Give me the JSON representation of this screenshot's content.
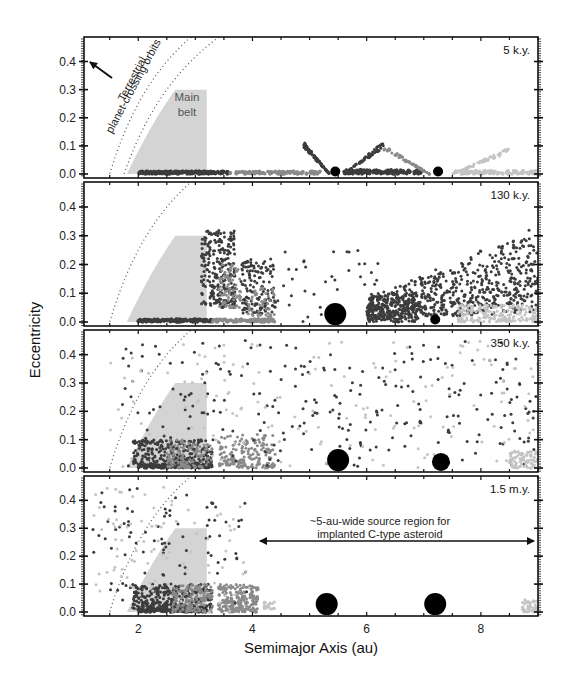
{
  "chart_data": {
    "type": "scatter",
    "layout": "4 vertically stacked panels sharing x-axis",
    "xlabel": "Semimajor Axis (au)",
    "ylabel": "Eccentricity",
    "xlim": [
      1.05,
      9.0
    ],
    "ylim": [
      -0.02,
      0.48
    ],
    "x_ticks": [
      2,
      4,
      6,
      8
    ],
    "y_ticks": [
      0.0,
      0.1,
      0.2,
      0.3,
      0.4
    ],
    "y_tick_labels": [
      "0.0",
      "0.1",
      "0.2",
      "0.3",
      "0.4"
    ],
    "grid": false,
    "colors": {
      "main_belt": "#d4d4d4",
      "dark_points": "#3c3c3c",
      "mid_points": "#8a8a8a",
      "light_points": "#c4c4c4",
      "planet": "#000000",
      "curve": "#555555"
    },
    "main_belt_region": {
      "a_min": 1.8,
      "a_max": 3.2,
      "e_max": 0.3,
      "label": "Main belt"
    },
    "planet_crossing_curve": {
      "description": "dotted line q = 1.3 au (e = 1 - 1.3/a)",
      "q": 1.3
    },
    "annotations": {
      "terrestrial": "Terrestrial planet-crossing orbits",
      "terrestrial_line1": "Terrestrial",
      "terrestrial_line2": "planet-crossing orbits",
      "source_region_line1": "~5-au-wide source region for",
      "source_region_line2": "implanted C-type asteroid",
      "source_region_range": [
        4.1,
        8.9
      ],
      "source_region_e": 0.25
    },
    "panels": [
      {
        "label": "5 k.y.",
        "planets": [
          {
            "name": "Jupiter",
            "a": 5.45,
            "e": 0.0,
            "size": "small"
          },
          {
            "name": "Saturn",
            "a": 7.25,
            "e": 0.0,
            "size": "small"
          }
        ],
        "clusters": [
          {
            "shade": "dark",
            "kind": "band",
            "a": [
              2.0,
              3.6
            ],
            "e": [
              0.0,
              0.01
            ],
            "n": 220
          },
          {
            "shade": "mid",
            "kind": "band",
            "a": [
              3.6,
              5.2
            ],
            "e": [
              0.0,
              0.01
            ],
            "n": 120
          },
          {
            "shade": "dark",
            "kind": "wedge",
            "a": [
              4.9,
              5.35
            ],
            "e_at_a0": 0.11,
            "e_at_a1": 0.0,
            "n": 90
          },
          {
            "shade": "dark",
            "kind": "band",
            "a": [
              5.6,
              7.0
            ],
            "e": [
              0.0,
              0.015
            ],
            "n": 160
          },
          {
            "shade": "dark",
            "kind": "wedge",
            "a": [
              5.6,
              6.3
            ],
            "e_at_a0": 0.0,
            "e_at_a1": 0.11,
            "n": 80
          },
          {
            "shade": "mid",
            "kind": "wedge",
            "a": [
              6.3,
              7.1
            ],
            "e_at_a0": 0.1,
            "e_at_a1": 0.0,
            "n": 70
          },
          {
            "shade": "light",
            "kind": "band",
            "a": [
              7.5,
              9.0
            ],
            "e": [
              0.0,
              0.012
            ],
            "n": 110
          },
          {
            "shade": "light",
            "kind": "wedge",
            "a": [
              7.5,
              8.5
            ],
            "e_at_a0": 0.0,
            "e_at_a1": 0.09,
            "n": 70
          }
        ]
      },
      {
        "label": "130 k.y.",
        "planets": [
          {
            "name": "Jupiter",
            "a": 5.45,
            "e": 0.0,
            "size": "large"
          },
          {
            "name": "Saturn",
            "a": 7.2,
            "e": 0.0,
            "size": "small"
          }
        ],
        "clusters": [
          {
            "shade": "dark",
            "kind": "band",
            "a": [
              2.0,
              3.3
            ],
            "e": [
              0.0,
              0.01
            ],
            "n": 150
          },
          {
            "shade": "mid",
            "kind": "band",
            "a": [
              3.3,
              4.4
            ],
            "e": [
              0.0,
              0.01
            ],
            "n": 90
          },
          {
            "shade": "dark",
            "kind": "box",
            "a": [
              3.1,
              3.7
            ],
            "e": [
              0.05,
              0.32
            ],
            "n": 260
          },
          {
            "shade": "mid",
            "kind": "box",
            "a": [
              3.4,
              3.8
            ],
            "e": [
              0.05,
              0.2
            ],
            "n": 80
          },
          {
            "shade": "dark",
            "kind": "box",
            "a": [
              3.8,
              4.4
            ],
            "e": [
              0.03,
              0.22
            ],
            "n": 140
          },
          {
            "shade": "mid",
            "kind": "box",
            "a": [
              3.9,
              4.4
            ],
            "e": [
              0.0,
              0.12
            ],
            "n": 60
          },
          {
            "shade": "dark",
            "kind": "scatter",
            "a": [
              4.4,
              6.2
            ],
            "e": [
              0.0,
              0.25
            ],
            "n": 40
          },
          {
            "shade": "dark",
            "kind": "box",
            "a": [
              6.0,
              6.9
            ],
            "e": [
              0.0,
              0.1
            ],
            "n": 160
          },
          {
            "shade": "dark",
            "kind": "wedge_fill",
            "a": [
              6.0,
              9.0
            ],
            "e_at_a0": 0.08,
            "e_at_a1": 0.34,
            "n": 700
          },
          {
            "shade": "light",
            "kind": "box",
            "a": [
              7.6,
              9.0
            ],
            "e": [
              0.0,
              0.06
            ],
            "n": 200
          }
        ]
      },
      {
        "label": "350 k.y.",
        "planets": [
          {
            "name": "Jupiter",
            "a": 5.5,
            "e": 0.0,
            "size": "large"
          },
          {
            "name": "Saturn",
            "a": 7.3,
            "e": 0.0,
            "size": "medium"
          }
        ],
        "clusters": [
          {
            "shade": "dark",
            "kind": "band",
            "a": [
              2.0,
              3.3
            ],
            "e": [
              0.0,
              0.01
            ],
            "n": 140
          },
          {
            "shade": "dark",
            "kind": "box",
            "a": [
              1.9,
              3.3
            ],
            "e": [
              0.01,
              0.1
            ],
            "n": 260
          },
          {
            "shade": "mid",
            "kind": "box",
            "a": [
              2.5,
              3.3
            ],
            "e": [
              0.0,
              0.1
            ],
            "n": 120
          },
          {
            "shade": "mid",
            "kind": "box",
            "a": [
              3.4,
              4.4
            ],
            "e": [
              0.0,
              0.12
            ],
            "n": 180
          },
          {
            "shade": "dark",
            "kind": "scatter",
            "a": [
              1.7,
              9.0
            ],
            "e": [
              0.0,
              0.45
            ],
            "n": 260
          },
          {
            "shade": "light",
            "kind": "scatter",
            "a": [
              1.5,
              9.0
            ],
            "e": [
              0.0,
              0.45
            ],
            "n": 160
          },
          {
            "shade": "light",
            "kind": "box",
            "a": [
              8.5,
              9.0
            ],
            "e": [
              0.0,
              0.06
            ],
            "n": 90
          }
        ]
      },
      {
        "label": "1.5 m.y.",
        "planets": [
          {
            "name": "Jupiter",
            "a": 5.3,
            "e": 0.0,
            "size": "large"
          },
          {
            "name": "Saturn",
            "a": 7.2,
            "e": 0.0,
            "size": "large"
          }
        ],
        "clusters": [
          {
            "shade": "dark",
            "kind": "band",
            "a": [
              2.0,
              3.2
            ],
            "e": [
              0.0,
              0.01
            ],
            "n": 130
          },
          {
            "shade": "dark",
            "kind": "box",
            "a": [
              1.9,
              3.3
            ],
            "e": [
              0.01,
              0.1
            ],
            "n": 300
          },
          {
            "shade": "mid",
            "kind": "box",
            "a": [
              2.6,
              3.3
            ],
            "e": [
              0.0,
              0.1
            ],
            "n": 140
          },
          {
            "shade": "mid",
            "kind": "box",
            "a": [
              3.4,
              4.1
            ],
            "e": [
              0.0,
              0.1
            ],
            "n": 220
          },
          {
            "shade": "light",
            "kind": "box",
            "a": [
              4.2,
              4.4
            ],
            "e": [
              0.01,
              0.04
            ],
            "n": 20
          },
          {
            "shade": "dark",
            "kind": "scatter",
            "a": [
              1.2,
              3.9
            ],
            "e": [
              0.0,
              0.45
            ],
            "n": 90
          },
          {
            "shade": "light",
            "kind": "scatter",
            "a": [
              1.2,
              3.9
            ],
            "e": [
              0.0,
              0.45
            ],
            "n": 90
          },
          {
            "shade": "light",
            "kind": "box",
            "a": [
              8.7,
              9.0
            ],
            "e": [
              0.0,
              0.05
            ],
            "n": 40
          }
        ]
      }
    ]
  }
}
